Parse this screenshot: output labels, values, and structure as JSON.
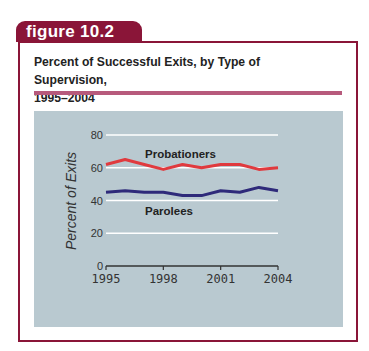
{
  "figure_label": "figure 10.2",
  "title_line1": "Percent of Successful Exits, by Type of Supervision,",
  "title_line2": "1995–2004",
  "colors": {
    "frame": "#8a1538",
    "rule": "#b75a7c",
    "panel": "#b9c9d0",
    "probationers": "#e03a3e",
    "parolees": "#2e2a7a"
  },
  "chart_data": {
    "type": "line",
    "title": "Percent of Successful Exits, by Type of Supervision, 1995–2004",
    "xlabel": "",
    "ylabel": "Percent of Exits",
    "x": [
      1995,
      1996,
      1997,
      1998,
      1999,
      2000,
      2001,
      2002,
      2003,
      2004
    ],
    "xticks": [
      "1995",
      "1998",
      "2001",
      "2004"
    ],
    "yticks": [
      "0",
      "20",
      "40",
      "60",
      "80"
    ],
    "ylim": [
      0,
      80
    ],
    "grid": true,
    "series": [
      {
        "name": "Probationers",
        "values": [
          62,
          65,
          62,
          59,
          62,
          60,
          62,
          62,
          59,
          60
        ]
      },
      {
        "name": "Parolees",
        "values": [
          45,
          46,
          45,
          45,
          43,
          43,
          46,
          45,
          48,
          46
        ]
      }
    ],
    "annotations": [
      "Probationers",
      "Parolees"
    ]
  }
}
